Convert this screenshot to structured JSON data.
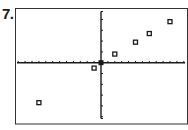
{
  "problem_label": "7.",
  "chart_data": {
    "type": "scatter",
    "title": "",
    "xlabel": "",
    "ylabel": "",
    "xlim": [
      -12,
      12
    ],
    "ylim": [
      -5,
      5
    ],
    "xscl": 1,
    "yscl": 1,
    "grid": false,
    "legend": null,
    "marker": "square",
    "points": [
      {
        "x": -9,
        "y": -3.7
      },
      {
        "x": -1,
        "y": -0.5
      },
      {
        "x": 0,
        "y": 0
      },
      {
        "x": 2,
        "y": 0.8
      },
      {
        "x": 5,
        "y": 1.9
      },
      {
        "x": 7,
        "y": 2.7
      },
      {
        "x": 10,
        "y": 3.8
      }
    ]
  },
  "colors": {
    "axis": "#1a1a1a",
    "frame": "#333333",
    "marker": "#1a1a1a"
  }
}
